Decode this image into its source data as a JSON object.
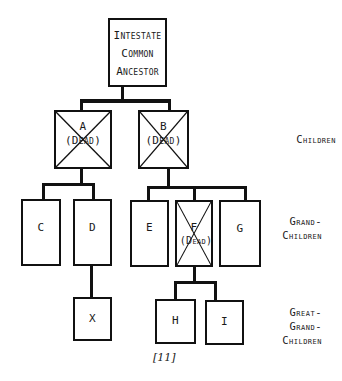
{
  "diagram": {
    "type": "family-tree",
    "root": {
      "label_lines": [
        "Intestate",
        "Common",
        "Ancestor"
      ]
    },
    "nodes": [
      {
        "id": "A",
        "label": "A",
        "note": "(Dead)",
        "dead": true,
        "generation": "children"
      },
      {
        "id": "B",
        "label": "B",
        "note": "(Dead)",
        "dead": true,
        "generation": "children"
      },
      {
        "id": "C",
        "label": "C",
        "dead": false,
        "parent": "A",
        "generation": "grandchildren"
      },
      {
        "id": "D",
        "label": "D",
        "dead": false,
        "parent": "A",
        "generation": "grandchildren"
      },
      {
        "id": "E",
        "label": "E",
        "dead": false,
        "parent": "B",
        "generation": "grandchildren"
      },
      {
        "id": "F",
        "label": "F",
        "note": "(Dead)",
        "dead": true,
        "parent": "B",
        "generation": "grandchildren"
      },
      {
        "id": "G",
        "label": "G",
        "dead": false,
        "parent": "B",
        "generation": "grandchildren"
      },
      {
        "id": "X",
        "label": "X",
        "dead": false,
        "parent": "D",
        "generation": "great-grandchildren"
      },
      {
        "id": "H",
        "label": "H",
        "dead": false,
        "parent": "F",
        "generation": "great-grandchildren"
      },
      {
        "id": "I",
        "label": "I",
        "dead": false,
        "parent": "F",
        "generation": "great-grandchildren"
      }
    ],
    "generations": {
      "children": [
        "Children"
      ],
      "grandchildren": [
        "Grand-",
        "Children"
      ],
      "great_grandchildren": [
        "Great-",
        "Grand-",
        "Children"
      ]
    },
    "caption": "[11]"
  }
}
